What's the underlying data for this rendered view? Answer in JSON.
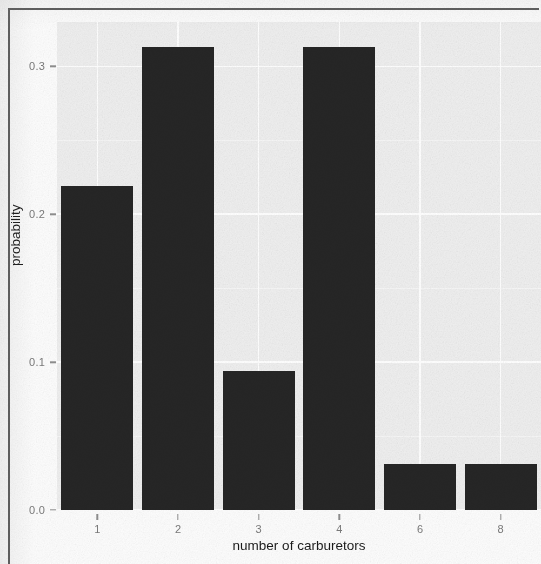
{
  "chart_data": {
    "type": "bar",
    "title": "",
    "subtitle": "",
    "xlabel": "number of carburetors",
    "ylabel": "probability",
    "categories": [
      "1",
      "2",
      "3",
      "4",
      "6",
      "8"
    ],
    "values": [
      0.219,
      0.313,
      0.094,
      0.313,
      0.031,
      0.031
    ],
    "series": [
      {
        "name": "probability",
        "values": [
          0.219,
          0.313,
          0.094,
          0.313,
          0.031,
          0.031
        ]
      }
    ],
    "ylim": [
      0.0,
      0.33
    ],
    "ytick_labels": [
      "0.0",
      "0.1",
      "0.2",
      "0.3"
    ],
    "ytick_values": [
      0.0,
      0.1,
      0.2,
      0.3
    ],
    "xtick_labels": [
      "1",
      "2",
      "3",
      "4",
      "6",
      "8"
    ],
    "grid": "major-y-and-x-white-on-gray",
    "legend": "none",
    "bar_color": "#262626",
    "panel_color": "#efefef",
    "gridline_color": "#ffffff",
    "axis_text_color": "#7a7a7a",
    "axis_title_color": "#1b1b1b"
  }
}
